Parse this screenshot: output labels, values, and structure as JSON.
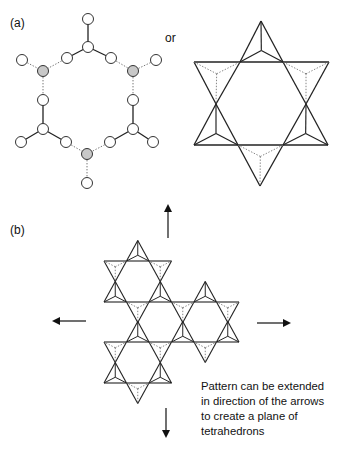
{
  "figure": {
    "panel_a": {
      "label": "(a)",
      "connector": "or",
      "ball_and_stick": {
        "description": "Ring of six SiO4 tetrahedra shown as spheres; shared (bridging) oxygens shaded grey",
        "colors": {
          "atom_fill": "#ffffff",
          "shared_atom_fill": "#c8c8c8",
          "bond": "#333333"
        }
      },
      "polyhedral": {
        "description": "Same six-membered ring drawn as corner-sharing tetrahedra forming a six-pointed star"
      }
    },
    "panel_b": {
      "label": "(b)",
      "description": "Extended sheet of corner-sharing tetrahedra (kagome-like pattern)",
      "arrows": [
        "up",
        "left",
        "right",
        "down"
      ],
      "caption_lines": [
        "Pattern can be extended",
        "in direction of the arrows",
        "to create a plane of",
        "tetrahedrons"
      ]
    }
  }
}
